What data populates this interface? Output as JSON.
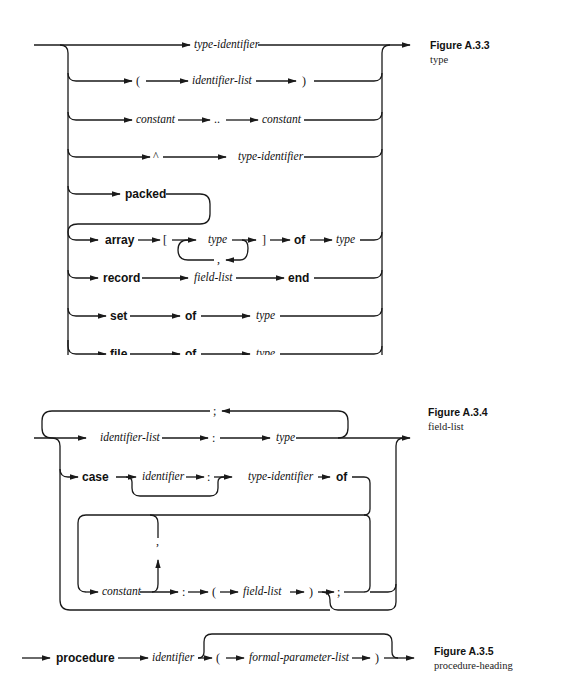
{
  "figures": [
    {
      "id": "A.3.3",
      "title": "Figure A.3.3",
      "subtitle": "type",
      "rows": [
        {
          "items": [
            "type-identifier"
          ]
        },
        {
          "items": [
            "(",
            "identifier-list",
            ")"
          ]
        },
        {
          "items": [
            "constant",
            "..",
            "constant"
          ]
        },
        {
          "items": [
            "^",
            "type-identifier"
          ]
        },
        {
          "items": [
            "packed"
          ]
        },
        {
          "items": [
            "array",
            "[",
            "type",
            ",",
            "]",
            "of",
            "type"
          ]
        },
        {
          "items": [
            "record",
            "field-list",
            "end"
          ]
        },
        {
          "items": [
            "set",
            "of",
            "type"
          ]
        },
        {
          "items": [
            "file",
            "of",
            "type"
          ]
        }
      ]
    },
    {
      "id": "A.3.4",
      "title": "Figure A.3.4",
      "subtitle": "field-list",
      "rows": [
        {
          "items": [
            ";",
            "identifier-list",
            ":",
            "type"
          ]
        },
        {
          "items": [
            "case",
            "identifier",
            ":",
            "type-identifier",
            "of"
          ]
        },
        {
          "items": [
            "constant",
            ",",
            ":",
            "(",
            "field-list",
            ")",
            ";"
          ]
        }
      ]
    },
    {
      "id": "A.3.5",
      "title": "Figure A.3.5",
      "subtitle": "procedure-heading",
      "rows": [
        {
          "items": [
            "procedure",
            "identifier",
            "(",
            "formal-parameter-list",
            ")"
          ]
        }
      ]
    }
  ]
}
